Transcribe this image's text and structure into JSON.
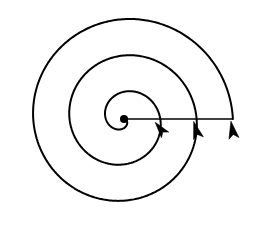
{
  "figure": {
    "background_color": "#ffffff",
    "stroke_color": "#000000",
    "stroke_width": 2,
    "canvas": {
      "width": 253,
      "height": 247
    }
  },
  "center_point": {
    "label": "center-dot",
    "x": 124,
    "y": 119,
    "radius": 4,
    "color": "#000000"
  },
  "radial_line": {
    "label": "radial-reference-line",
    "x1": 124,
    "y1": 119,
    "x2": 233,
    "y2": 119,
    "length": 109,
    "color": "#000000"
  },
  "spiral": {
    "type": "archimedean",
    "turns": 3,
    "start_radius": 0,
    "growth_per_turn": 36.3,
    "direction": "clockwise",
    "start_angle_deg": 0,
    "end_angle_deg": 1080,
    "crossing_radii": [
      36,
      73,
      109
    ],
    "outer_extents": {
      "left": 22,
      "right": 233,
      "top": 12,
      "bottom": 228
    }
  },
  "arrowheads": [
    {
      "label": "arrowhead-inner",
      "x": 162,
      "y": 131,
      "angle_deg": 52,
      "size": 11
    },
    {
      "label": "arrowhead-middle",
      "x": 197,
      "y": 133,
      "angle_deg": 74,
      "size": 12
    },
    {
      "label": "arrowhead-outer",
      "x": 233,
      "y": 133,
      "angle_deg": 80,
      "size": 12
    }
  ],
  "chart_data": {
    "type": "line",
    "xlabel": "",
    "ylabel": "",
    "series": [
      {
        "name": "spiral-turn-1",
        "radius_at_0deg": 0,
        "radius_at_360deg": 36
      },
      {
        "name": "spiral-turn-2",
        "radius_at_360deg": 36,
        "radius_at_720deg": 73
      },
      {
        "name": "spiral-turn-3",
        "radius_at_720deg": 73,
        "radius_at_1080deg": 109
      }
    ],
    "categories": [
      "0°",
      "360°",
      "720°",
      "1080°"
    ],
    "values": [
      0,
      36,
      73,
      109
    ],
    "legend": [],
    "grid": false
  }
}
